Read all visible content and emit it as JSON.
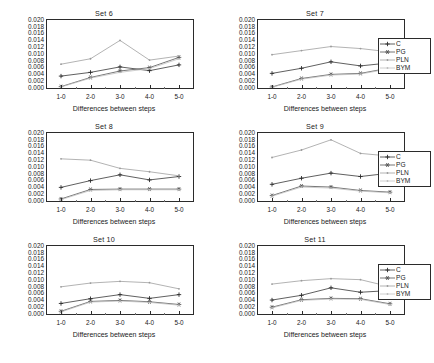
{
  "figure": {
    "rows": 3,
    "cols": 2,
    "background": "#ffffff"
  },
  "axis": {
    "ylim": [
      0.0,
      0.02
    ],
    "yticks": [
      "0.000",
      "0.002",
      "0.004",
      "0.006",
      "0.008",
      "0.010",
      "0.012",
      "0.014",
      "0.016",
      "0.018",
      "0.020"
    ],
    "ytick_values": [
      0.0,
      0.002,
      0.004,
      0.006,
      0.008,
      0.01,
      0.012,
      0.014,
      0.016,
      0.018,
      0.02
    ],
    "xticks": [
      "1-0",
      "2-0",
      "3-0",
      "4-0",
      "5-0"
    ],
    "xlabel": "Differences between steps",
    "ylabel": "",
    "grid": false
  },
  "legend": {
    "position": "right-of-second-column",
    "entries": [
      {
        "label": "C",
        "color": "#2b2b2b",
        "marker": "plus",
        "linestyle": "solid"
      },
      {
        "label": "PG",
        "color": "#4a4a4a",
        "marker": "star",
        "linestyle": "solid"
      },
      {
        "label": "PLN",
        "color": "#9a9a9a",
        "marker": "dot",
        "linestyle": "solid"
      },
      {
        "label": "BYM",
        "color": "#bdbdbd",
        "marker": "dot",
        "linestyle": "solid"
      }
    ]
  },
  "chart_data": [
    {
      "type": "line",
      "title": "Set 6",
      "xlabel": "Differences between steps",
      "ylabel": "",
      "categories": [
        "1-0",
        "2-0",
        "3-0",
        "4-0",
        "5-0"
      ],
      "ylim": [
        0.0,
        0.02
      ],
      "grid": false,
      "legend": [
        "C",
        "PG",
        "PLN",
        "BYM"
      ],
      "series": [
        {
          "name": "C",
          "values": [
            0.0035,
            0.0046,
            0.0062,
            0.0051,
            0.0068
          ]
        },
        {
          "name": "PG",
          "values": [
            0.0004,
            0.0031,
            0.005,
            0.006,
            0.009
          ]
        },
        {
          "name": "PLN",
          "values": [
            0.007,
            0.0086,
            0.014,
            0.0082,
            0.0094
          ]
        },
        {
          "name": "BYM",
          "values": [
            0.0003,
            0.0029,
            0.0046,
            0.0057,
            0.0086
          ]
        }
      ]
    },
    {
      "type": "line",
      "title": "Set 7",
      "xlabel": "Differences between steps",
      "ylabel": "",
      "categories": [
        "1-0",
        "2-0",
        "3-0",
        "4-0",
        "5-0"
      ],
      "ylim": [
        0.0,
        0.02
      ],
      "grid": false,
      "legend": [
        "C",
        "PG",
        "PLN",
        "BYM"
      ],
      "series": [
        {
          "name": "C",
          "values": [
            0.0043,
            0.0058,
            0.0077,
            0.0065,
            0.0074
          ]
        },
        {
          "name": "PG",
          "values": [
            0.0003,
            0.0028,
            0.004,
            0.0043,
            0.0059
          ]
        },
        {
          "name": "PLN",
          "values": [
            0.0098,
            0.011,
            0.0122,
            0.0116,
            0.0106
          ]
        },
        {
          "name": "BYM",
          "values": [
            0.0002,
            0.0026,
            0.0038,
            0.0041,
            0.0057
          ]
        }
      ]
    },
    {
      "type": "line",
      "title": "Set 8",
      "xlabel": "Differences between steps",
      "ylabel": "",
      "categories": [
        "1-0",
        "2-0",
        "3-0",
        "4-0",
        "5-0"
      ],
      "ylim": [
        0.0,
        0.02
      ],
      "grid": false,
      "legend": [
        "C",
        "PG",
        "PLN",
        "BYM"
      ],
      "series": [
        {
          "name": "C",
          "values": [
            0.004,
            0.006,
            0.0077,
            0.0062,
            0.0072
          ]
        },
        {
          "name": "PG",
          "values": [
            0.0006,
            0.0034,
            0.0035,
            0.0035,
            0.0035
          ]
        },
        {
          "name": "PLN",
          "values": [
            0.0124,
            0.012,
            0.0096,
            0.0086,
            0.0074
          ]
        },
        {
          "name": "BYM",
          "values": [
            0.0004,
            0.0031,
            0.0033,
            0.0033,
            0.0033
          ]
        }
      ]
    },
    {
      "type": "line",
      "title": "Set 9",
      "xlabel": "Differences between steps",
      "ylabel": "",
      "categories": [
        "1-0",
        "2-0",
        "3-0",
        "4-0",
        "5-0"
      ],
      "ylim": [
        0.0,
        0.02
      ],
      "grid": false,
      "legend": [
        "C",
        "PG",
        "PLN",
        "BYM"
      ],
      "series": [
        {
          "name": "C",
          "values": [
            0.0049,
            0.0067,
            0.0082,
            0.0072,
            0.0082
          ]
        },
        {
          "name": "PG",
          "values": [
            0.0016,
            0.0044,
            0.0041,
            0.0031,
            0.0026
          ]
        },
        {
          "name": "PLN",
          "values": [
            0.0128,
            0.015,
            0.018,
            0.014,
            0.0132
          ]
        },
        {
          "name": "BYM",
          "values": [
            0.0014,
            0.0041,
            0.0038,
            0.0029,
            0.0024
          ]
        }
      ]
    },
    {
      "type": "line",
      "title": "Set 10",
      "xlabel": "Differences between steps",
      "ylabel": "",
      "categories": [
        "1-0",
        "2-0",
        "3-0",
        "4-0",
        "5-0"
      ],
      "ylim": [
        0.0,
        0.02
      ],
      "grid": false,
      "legend": [
        "C",
        "PG",
        "PLN",
        "BYM"
      ],
      "series": [
        {
          "name": "C",
          "values": [
            0.0031,
            0.0045,
            0.0057,
            0.0046,
            0.0057
          ]
        },
        {
          "name": "PG",
          "values": [
            0.0008,
            0.0037,
            0.004,
            0.0036,
            0.0028
          ]
        },
        {
          "name": "PLN",
          "values": [
            0.008,
            0.0091,
            0.0096,
            0.0092,
            0.0074
          ]
        },
        {
          "name": "BYM",
          "values": [
            0.0006,
            0.0035,
            0.0038,
            0.0034,
            0.0026
          ]
        }
      ]
    },
    {
      "type": "line",
      "title": "Set 11",
      "xlabel": "Differences between steps",
      "ylabel": "",
      "categories": [
        "1-0",
        "2-0",
        "3-0",
        "4-0",
        "5-0"
      ],
      "ylim": [
        0.0,
        0.02
      ],
      "grid": false,
      "legend": [
        "C",
        "PG",
        "PLN",
        "BYM"
      ],
      "series": [
        {
          "name": "C",
          "values": [
            0.0041,
            0.0055,
            0.0077,
            0.0064,
            0.0069
          ]
        },
        {
          "name": "PG",
          "values": [
            0.002,
            0.0042,
            0.0046,
            0.0045,
            0.003
          ]
        },
        {
          "name": "PLN",
          "values": [
            0.0088,
            0.0098,
            0.0104,
            0.0101,
            0.008
          ]
        },
        {
          "name": "BYM",
          "values": [
            0.0018,
            0.004,
            0.0044,
            0.0043,
            0.0028
          ]
        }
      ]
    }
  ]
}
